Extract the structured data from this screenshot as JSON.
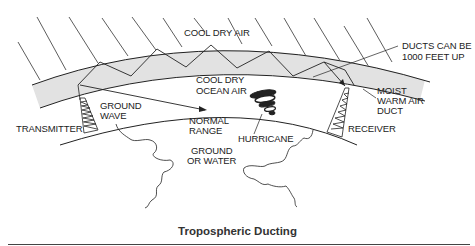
{
  "diagram": {
    "title": "Tropospheric Ducting",
    "labels": {
      "cool_dry_air": "COOL DRY AIR",
      "ducts_can_be_line1": "DUCTS CAN BE",
      "ducts_can_be_line2": "1000 FEET UP",
      "cool_dry_ocean_air_line1": "COOL DRY",
      "cool_dry_ocean_air_line2": "OCEAN AIR",
      "moist_line1": "MOIST",
      "moist_line2": "WARM AIR",
      "moist_line3": "DUCT",
      "ground_wave_line1": "GROUND",
      "ground_wave_line2": "WAVE",
      "transmitter": "TRANSMITTER",
      "normal_range_line1": "NORMAL",
      "normal_range_line2": "RANGE",
      "hurricane": "HURRICANE",
      "receiver": "RECEIVER",
      "ground_or_water_line1": "GROUND",
      "ground_or_water_line2": "OR WATER"
    },
    "colors": {
      "duct_fill": "#e2e2e2",
      "line": "#222222",
      "background": "#ffffff"
    }
  }
}
